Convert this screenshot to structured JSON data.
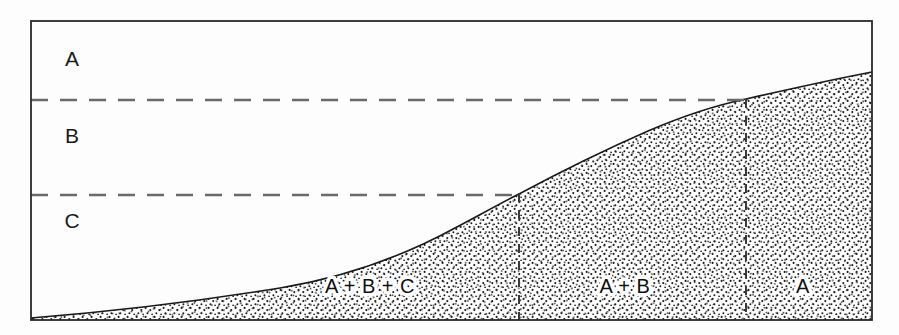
{
  "figure": {
    "frame": {
      "left": 31,
      "top": 21,
      "right": 872,
      "bottom": 320,
      "stroke_color": "#2a2a2a"
    },
    "zones": [
      {
        "id": "zone-a",
        "label": "A",
        "x": 72,
        "y": 60
      },
      {
        "id": "zone-b",
        "label": "B",
        "x": 72,
        "y": 137
      },
      {
        "id": "zone-c",
        "label": "C",
        "x": 72,
        "y": 222
      }
    ],
    "boundaries": [
      {
        "id": "boundary-a-b",
        "y": 100,
        "x_start": 31,
        "x_end": 748,
        "style": "dashed"
      },
      {
        "id": "boundary-b-c",
        "y": 195,
        "x_start": 31,
        "x_end": 520,
        "style": "dashed"
      }
    ],
    "verticals": [
      {
        "id": "divider-abc-ab",
        "x": 519,
        "y_top": 193,
        "y_bottom": 320,
        "style": "dashed"
      },
      {
        "id": "divider-ab-a",
        "x": 746,
        "y_top": 99,
        "y_bottom": 320,
        "style": "dashed"
      }
    ],
    "symbols": [
      {
        "id": "wing-symbol-a",
        "zone": "A",
        "posture": "raised-v-wings",
        "cx": 325,
        "cy": 62
      },
      {
        "id": "wing-symbol-b",
        "zone": "B",
        "posture": "flat-outstretched-wings",
        "cx": 192,
        "cy": 140
      },
      {
        "id": "wing-symbol-c",
        "zone": "C",
        "posture": "drooped-u-wings",
        "cx": 128,
        "cy": 226
      }
    ],
    "deposit_labels": [
      {
        "id": "deposit-abc",
        "label": "A + B + C",
        "x": 370,
        "y": 288
      },
      {
        "id": "deposit-ab",
        "label": "A + B",
        "x": 625,
        "y": 288
      },
      {
        "id": "deposit-a",
        "label": "A",
        "x": 803,
        "y": 288
      }
    ],
    "terrain": {
      "id": "terrain-profile",
      "description": "stippled ground rising left to right",
      "stipple_color": "#1f1f1f",
      "outline_color": "#1a1a1a",
      "points": [
        {
          "x": 31,
          "y": 318
        },
        {
          "x": 120,
          "y": 310
        },
        {
          "x": 200,
          "y": 300
        },
        {
          "x": 280,
          "y": 288
        },
        {
          "x": 360,
          "y": 272
        },
        {
          "x": 440,
          "y": 240
        },
        {
          "x": 519,
          "y": 194
        },
        {
          "x": 600,
          "y": 152
        },
        {
          "x": 680,
          "y": 120
        },
        {
          "x": 746,
          "y": 99
        },
        {
          "x": 810,
          "y": 83
        },
        {
          "x": 872,
          "y": 72
        }
      ]
    },
    "colors": {
      "ink": "#1b1b1b",
      "dash": "#6a6a6a",
      "background": "#ffffff"
    }
  }
}
